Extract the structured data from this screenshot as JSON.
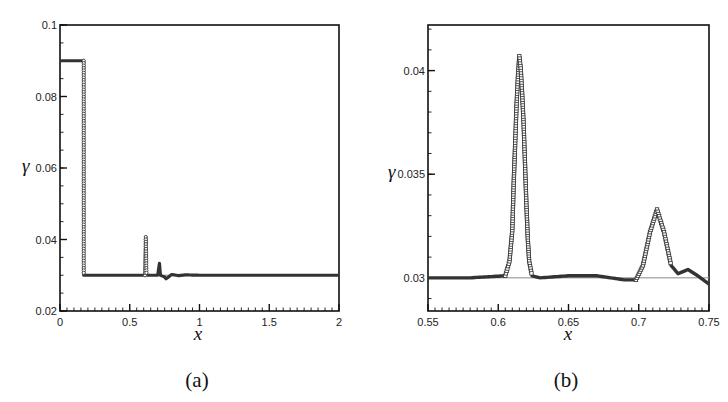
{
  "chart_data": [
    {
      "panel": "(a)",
      "type": "line",
      "title": "",
      "xlabel": "x",
      "ylabel": "γ",
      "xlim": [
        0,
        2
      ],
      "ylim": [
        0.02,
        0.1
      ],
      "xticks": [
        "0",
        "0.5",
        "1",
        "1.5",
        "2"
      ],
      "yticks": [
        "0.02",
        "0.04",
        "0.06",
        "0.08",
        "0.1"
      ],
      "grid": false,
      "legend": null,
      "series": [
        {
          "name": "numerical (markers)",
          "style": "circle markers, dense",
          "x": [
            0,
            0.17,
            0.17,
            0.6,
            0.61,
            0.615,
            0.62,
            0.63,
            0.7,
            0.713,
            0.72,
            0.75,
            0.76,
            0.8,
            0.85,
            0.9,
            1.0,
            1.5,
            2.0
          ],
          "y": [
            0.09,
            0.09,
            0.03,
            0.03,
            0.03,
            0.0407,
            0.03,
            0.03,
            0.03,
            0.0333,
            0.03,
            0.0295,
            0.029,
            0.0302,
            0.0299,
            0.0301,
            0.03,
            0.03,
            0.03
          ]
        },
        {
          "name": "exact",
          "style": "thin solid line",
          "x": [
            0,
            0.17,
            0.17,
            2.0
          ],
          "y": [
            0.09,
            0.09,
            0.03,
            0.03
          ]
        }
      ]
    },
    {
      "panel": "(b)",
      "type": "scatter",
      "title": "",
      "xlabel": "x",
      "ylabel": "γ",
      "xlim": [
        0.55,
        0.75
      ],
      "ylim": [
        0.0284,
        0.0422
      ],
      "xticks": [
        "0.55",
        "0.6",
        "0.65",
        "0.7",
        "0.75"
      ],
      "yticks": [
        "0.03",
        "0.035",
        "0.04"
      ],
      "grid": false,
      "legend": null,
      "series": [
        {
          "name": "numerical (markers)",
          "style": "open square markers",
          "x": [
            0.55,
            0.58,
            0.605,
            0.608,
            0.61,
            0.611,
            0.612,
            0.613,
            0.614,
            0.615,
            0.616,
            0.617,
            0.618,
            0.619,
            0.62,
            0.621,
            0.622,
            0.624,
            0.63,
            0.65,
            0.67,
            0.69,
            0.698,
            0.703,
            0.708,
            0.713,
            0.718,
            0.723,
            0.728,
            0.735,
            0.742,
            0.75
          ],
          "y": [
            0.03,
            0.03,
            0.0301,
            0.0308,
            0.0323,
            0.0346,
            0.0364,
            0.0383,
            0.0397,
            0.0407,
            0.0401,
            0.0389,
            0.0375,
            0.0356,
            0.0336,
            0.0319,
            0.0308,
            0.0301,
            0.03,
            0.0301,
            0.0301,
            0.0299,
            0.0299,
            0.0306,
            0.0322,
            0.0333,
            0.0322,
            0.0306,
            0.0302,
            0.0304,
            0.0301,
            0.0297
          ]
        },
        {
          "name": "exact",
          "style": "thin solid line",
          "x": [
            0.55,
            0.75
          ],
          "y": [
            0.03,
            0.03
          ]
        }
      ]
    }
  ],
  "figure": {
    "panel_a": {
      "caption": "(a)",
      "xlabel": "x",
      "ylabel": "γ",
      "x_ticks": [
        {
          "v": 0,
          "label": "0"
        },
        {
          "v": 0.5,
          "label": "0.5"
        },
        {
          "v": 1,
          "label": "1"
        },
        {
          "v": 1.5,
          "label": "1.5"
        },
        {
          "v": 2,
          "label": "2"
        }
      ],
      "y_ticks": [
        {
          "v": 0.02,
          "label": "0.02"
        },
        {
          "v": 0.04,
          "label": "0.04"
        },
        {
          "v": 0.06,
          "label": "0.06"
        },
        {
          "v": 0.08,
          "label": "0.08"
        },
        {
          "v": 0.1,
          "label": "0.1"
        }
      ]
    },
    "panel_b": {
      "caption": "(b)",
      "xlabel": "x",
      "ylabel": "γ",
      "x_ticks": [
        {
          "v": 0.55,
          "label": "0.55"
        },
        {
          "v": 0.6,
          "label": "0.6"
        },
        {
          "v": 0.65,
          "label": "0.65"
        },
        {
          "v": 0.7,
          "label": "0.7"
        },
        {
          "v": 0.75,
          "label": "0.75"
        }
      ],
      "y_ticks": [
        {
          "v": 0.03,
          "label": "0.03"
        },
        {
          "v": 0.035,
          "label": "0.035"
        },
        {
          "v": 0.04,
          "label": "0.04"
        }
      ]
    },
    "colors": {
      "axis": "#111111",
      "marker": "#333333",
      "exact_line": "#888888"
    }
  }
}
